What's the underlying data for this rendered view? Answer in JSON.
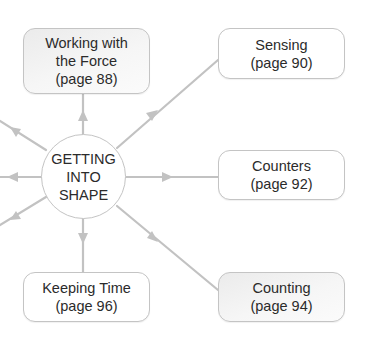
{
  "diagram": {
    "center": {
      "lines": [
        "GETTING",
        "INTO",
        "SHAPE"
      ]
    },
    "nodes": [
      {
        "id": "working-with-the-force",
        "lines": [
          "Working with",
          "the Force",
          "(page 88)"
        ],
        "shaded": true
      },
      {
        "id": "sensing",
        "lines": [
          "Sensing",
          "(page 90)"
        ],
        "shaded": false
      },
      {
        "id": "counters",
        "lines": [
          "Counters",
          "(page 92)"
        ],
        "shaded": false
      },
      {
        "id": "counting",
        "lines": [
          "Counting",
          "(page 94)"
        ],
        "shaded": true
      },
      {
        "id": "keeping-time",
        "lines": [
          "Keeping Time",
          "(page 96)"
        ],
        "shaded": false
      }
    ],
    "colors": {
      "line": "#c2c2c2",
      "border": "#c4c4c4",
      "text": "#2b2b2b",
      "shaded_fill": "#efefef"
    }
  }
}
